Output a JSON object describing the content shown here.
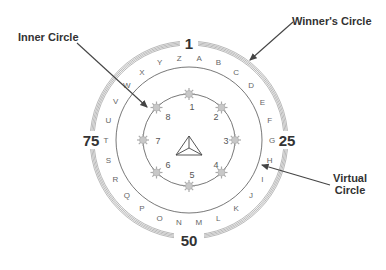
{
  "diagram": {
    "labels": {
      "inner_circle": "Inner Circle",
      "winners_circle": "Winner's Circle",
      "virtual_circle_line1": "Virtual",
      "virtual_circle_line2": "Circle"
    },
    "outer_ring_markers": {
      "top": "1",
      "right": "25",
      "bottom": "50",
      "left": "75"
    },
    "virtual_circle_letters": [
      "A",
      "B",
      "C",
      "D",
      "E",
      "F",
      "G",
      "H",
      "I",
      "J",
      "K",
      "L",
      "M",
      "N",
      "O",
      "P",
      "Q",
      "R",
      "S",
      "T",
      "U",
      "V",
      "W",
      "X",
      "Y",
      "Z"
    ],
    "inner_circle_numbers": [
      "1",
      "2",
      "3",
      "4",
      "5",
      "6",
      "7",
      "8"
    ],
    "center_icon": "triangle-pyramid-icon",
    "colors": {
      "ring": "#888888",
      "line": "#555555",
      "arrow": "#444444",
      "star": "#bbbbbb",
      "text": "#333333",
      "letter": "#666666"
    }
  }
}
